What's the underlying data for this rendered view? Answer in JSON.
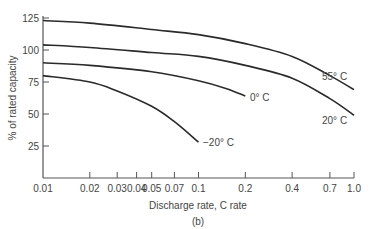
{
  "chart_data": {
    "type": "line",
    "title": "",
    "caption": "(b)",
    "xlabel": "Discharge rate, C rate",
    "ylabel": "% of rated capacity",
    "xscale": "log",
    "xlim": [
      0.01,
      1.0
    ],
    "ylim": [
      0,
      125
    ],
    "grid": false,
    "legend_position": "inline labels at curve ends",
    "x_ticks": [
      0.01,
      0.02,
      0.03,
      0.04,
      0.05,
      0.07,
      0.1,
      0.2,
      0.4,
      0.7,
      1.0
    ],
    "x_tick_labels": [
      "0.01",
      "0.02",
      "0.03",
      "0.04",
      "0.05",
      "0.07",
      "0.1",
      "0.2",
      "0.4",
      "0.7",
      "1.0"
    ],
    "y_ticks": [
      25,
      50,
      75,
      100,
      125
    ],
    "y_tick_labels": [
      "25",
      "50",
      "75",
      "100",
      "125"
    ],
    "series": [
      {
        "name": "55° C",
        "x": [
          0.01,
          0.02,
          0.05,
          0.1,
          0.2,
          0.4,
          0.7,
          1.0
        ],
        "values": [
          123,
          121,
          116,
          112,
          105,
          95,
          80,
          69
        ]
      },
      {
        "name": "20° C",
        "x": [
          0.01,
          0.02,
          0.05,
          0.1,
          0.2,
          0.4,
          0.7,
          1.0
        ],
        "values": [
          104,
          102,
          98,
          95,
          88,
          78,
          62,
          49
        ]
      },
      {
        "name": "0° C",
        "x": [
          0.01,
          0.02,
          0.05,
          0.1,
          0.15,
          0.2
        ],
        "values": [
          90,
          88,
          83,
          76,
          70,
          64
        ]
      },
      {
        "name": "−20° C",
        "x": [
          0.01,
          0.02,
          0.03,
          0.05,
          0.07,
          0.1
        ],
        "values": [
          80,
          75,
          68,
          56,
          44,
          28
        ]
      }
    ]
  }
}
